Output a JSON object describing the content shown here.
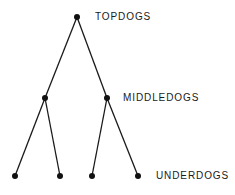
{
  "diagram": {
    "type": "tree",
    "colors": {
      "line": "#1a1a1a",
      "node": "#111111",
      "text": "#1a1a1a"
    },
    "levels": [
      {
        "name": "top",
        "label": "TOPDOGS",
        "label_x": 95,
        "label_y": 12
      },
      {
        "name": "middle",
        "label": "MIDDLEDOGS",
        "label_x": 123,
        "label_y": 93
      },
      {
        "name": "bottom",
        "label": "UNDERDOGS",
        "label_x": 156,
        "label_y": 171
      }
    ],
    "nodes": [
      {
        "id": "top",
        "x": 77,
        "y": 17,
        "level": "top"
      },
      {
        "id": "mid-left",
        "x": 45,
        "y": 98,
        "level": "middle"
      },
      {
        "id": "mid-right",
        "x": 107,
        "y": 98,
        "level": "middle"
      },
      {
        "id": "under-1",
        "x": 15,
        "y": 176,
        "level": "bottom"
      },
      {
        "id": "under-2",
        "x": 60,
        "y": 176,
        "level": "bottom"
      },
      {
        "id": "under-3",
        "x": 92,
        "y": 176,
        "level": "bottom"
      },
      {
        "id": "under-4",
        "x": 138,
        "y": 176,
        "level": "bottom"
      }
    ],
    "edges": [
      [
        "top",
        "mid-left"
      ],
      [
        "top",
        "mid-right"
      ],
      [
        "mid-left",
        "under-1"
      ],
      [
        "mid-left",
        "under-2"
      ],
      [
        "mid-right",
        "under-3"
      ],
      [
        "mid-right",
        "under-4"
      ]
    ]
  }
}
